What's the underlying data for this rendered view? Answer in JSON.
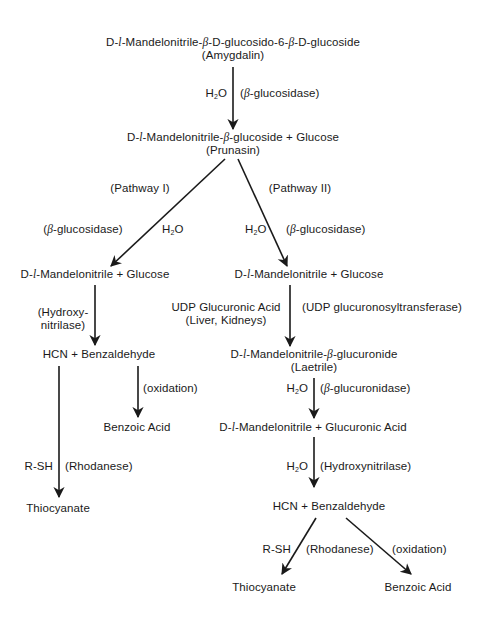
{
  "nodes": {
    "amygdalin": {
      "name": "D-l-Mandelonitrile-β-D-glucosido-6-β-D-glucoside",
      "alias": "(Amygdalin)"
    },
    "prunasin": {
      "name": "D-l-Mandelonitrile-β-glucoside + Glucose",
      "alias": "(Prunasin)"
    },
    "p1_mandelonitrile": {
      "name": "D-l-Mandelonitrile + Glucose"
    },
    "p2_mandelonitrile": {
      "name": "D-l-Mandelonitrile + Glucose"
    },
    "p1_hcn": {
      "name": "HCN + Benzaldehyde"
    },
    "p1_benzoic": {
      "name": "Benzoic Acid"
    },
    "p1_thiocyanate": {
      "name": "Thiocyanate"
    },
    "laetrile": {
      "name": "D-l-Mandelonitrile-β-glucuronide",
      "alias": "(Laetrile)"
    },
    "p2_mandelo_glucuronic": {
      "name": "D-l-Mandelonitrile + Glucuronic Acid"
    },
    "p2_hcn": {
      "name": "HCN + Benzaldehyde"
    },
    "p2_thiocyanate": {
      "name": "Thiocyanate"
    },
    "p2_benzoic": {
      "name": "Benzoic Acid"
    }
  },
  "edges": {
    "e1": {
      "left": "H2O",
      "right": "(β-glucosidase)"
    },
    "pathway1": {
      "label": "(Pathway I)",
      "left": "(β-glucosidase)",
      "right": "H2O"
    },
    "pathway2": {
      "label": "(Pathway II)",
      "left": "H2O",
      "right": "(β-glucosidase)"
    },
    "p1_hydroxy": {
      "line1": "(Hydroxy-",
      "line2": "nitrilase)"
    },
    "p1_oxidation": {
      "right": "(oxidation)"
    },
    "p1_rhodanese": {
      "left": "R-SH",
      "right": "(Rhodanese)"
    },
    "p2_udp": {
      "left1": "UDP Glucuronic Acid",
      "left2": "(Liver, Kidneys)",
      "right": "(UDP glucuronosyltransferase)"
    },
    "p2_glucuronidase": {
      "left": "H2O",
      "right": "(β-glucuronidase)"
    },
    "p2_hydroxynitrilase": {
      "left": "H2O",
      "right": "(Hydroxynitrilase)"
    },
    "p2_rhodanese": {
      "left": "R-SH",
      "label": "(Rhodanese)",
      "right": "(oxidation)"
    }
  },
  "colors": {
    "ink": "#1a1a1a",
    "background": "#ffffff"
  }
}
